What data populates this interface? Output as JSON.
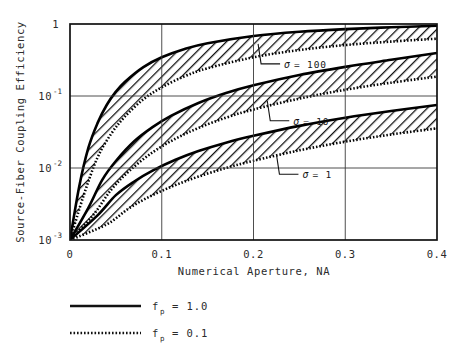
{
  "chart_data": {
    "type": "line",
    "title": "",
    "xlabel": "Numerical Aperture,  NA",
    "ylabel": "Source-Fiber Coupling Efficiency",
    "xlim": [
      0,
      0.4
    ],
    "ylim": [
      0.001,
      1
    ],
    "yscale": "log",
    "xscale": "linear",
    "grid": true,
    "xticks": [
      "0",
      "0.1",
      "0.2",
      "0.3",
      "0.4"
    ],
    "xtick_values": [
      0,
      0.1,
      0.2,
      0.3,
      0.4
    ],
    "ytick_labels": [
      "1",
      "10",
      "10",
      "10"
    ],
    "ytick_exponents": [
      "",
      "-1",
      "-2",
      "-3"
    ],
    "ytick_values": [
      1,
      0.1,
      0.01,
      0.001
    ],
    "legend_position": "below-axes-left",
    "series": [
      {
        "name": "sigma = 100, f_p = 1.0",
        "sigma": 100,
        "fp": 1.0,
        "style": "solid",
        "x": [
          0.0,
          0.01,
          0.02,
          0.03,
          0.04,
          0.05,
          0.06,
          0.08,
          0.1,
          0.125,
          0.15,
          0.2,
          0.25,
          0.3,
          0.35,
          0.4
        ],
        "y": [
          0.001,
          0.0055,
          0.019,
          0.042,
          0.075,
          0.115,
          0.158,
          0.252,
          0.345,
          0.45,
          0.54,
          0.68,
          0.78,
          0.85,
          0.9,
          0.945
        ]
      },
      {
        "name": "sigma = 100, f_p = 0.1",
        "sigma": 100,
        "fp": 0.1,
        "style": "dotted",
        "x": [
          0.0,
          0.015,
          0.03,
          0.045,
          0.06,
          0.08,
          0.1,
          0.125,
          0.15,
          0.2,
          0.25,
          0.3,
          0.35,
          0.4
        ],
        "y": [
          0.001,
          0.0042,
          0.014,
          0.03,
          0.052,
          0.09,
          0.132,
          0.188,
          0.243,
          0.345,
          0.435,
          0.51,
          0.57,
          0.625
        ]
      },
      {
        "name": "sigma = 10, f_p = 1.0",
        "sigma": 10,
        "fp": 1.0,
        "style": "solid",
        "x": [
          0.0,
          0.02,
          0.035,
          0.05,
          0.07,
          0.09,
          0.11,
          0.14,
          0.17,
          0.2,
          0.25,
          0.3,
          0.35,
          0.4
        ],
        "y": [
          0.001,
          0.0028,
          0.0068,
          0.0125,
          0.0235,
          0.037,
          0.053,
          0.08,
          0.11,
          0.141,
          0.196,
          0.254,
          0.318,
          0.395
        ]
      },
      {
        "name": "sigma = 10, f_p = 0.1",
        "sigma": 10,
        "fp": 0.1,
        "style": "dotted",
        "x": [
          0.0,
          0.025,
          0.045,
          0.065,
          0.09,
          0.115,
          0.14,
          0.17,
          0.2,
          0.25,
          0.3,
          0.35,
          0.4
        ],
        "y": [
          0.001,
          0.0022,
          0.005,
          0.0092,
          0.0165,
          0.0255,
          0.036,
          0.05,
          0.065,
          0.092,
          0.122,
          0.153,
          0.186
        ]
      },
      {
        "name": "sigma = 1, f_p = 1.0",
        "sigma": 1,
        "fp": 1.0,
        "style": "solid",
        "x": [
          0.0,
          0.03,
          0.05,
          0.07,
          0.09,
          0.115,
          0.14,
          0.17,
          0.2,
          0.25,
          0.3,
          0.35,
          0.4
        ],
        "y": [
          0.001,
          0.0022,
          0.0042,
          0.0065,
          0.0092,
          0.013,
          0.0172,
          0.0225,
          0.028,
          0.0385,
          0.05,
          0.062,
          0.075
        ]
      },
      {
        "name": "sigma = 1, f_p = 0.1",
        "sigma": 1,
        "fp": 0.1,
        "style": "dotted",
        "x": [
          0.0,
          0.04,
          0.065,
          0.09,
          0.115,
          0.14,
          0.17,
          0.2,
          0.25,
          0.3,
          0.35,
          0.4
        ],
        "y": [
          0.001,
          0.00165,
          0.0028,
          0.0042,
          0.0058,
          0.0076,
          0.01,
          0.0126,
          0.0176,
          0.0232,
          0.0292,
          0.0355
        ]
      }
    ],
    "annotations": [
      {
        "id": "sigma-100",
        "symbol": "σ",
        "text": "= 100",
        "x_data": 0.205,
        "y_data": 0.53
      },
      {
        "id": "sigma-10",
        "symbol": "σ",
        "text": "=  10",
        "x_data": 0.215,
        "y_data": 0.086
      },
      {
        "id": "sigma-1",
        "symbol": "σ",
        "text": "=  1",
        "x_data": 0.225,
        "y_data": 0.0155
      }
    ],
    "legend_entries": [
      {
        "id": "fp-1",
        "style": "solid",
        "symbol": "f",
        "subscript": "p",
        "value": "=  1.0"
      },
      {
        "id": "fp-01",
        "style": "dotted",
        "symbol": "f",
        "subscript": "p",
        "value": "=  0.1"
      }
    ]
  }
}
